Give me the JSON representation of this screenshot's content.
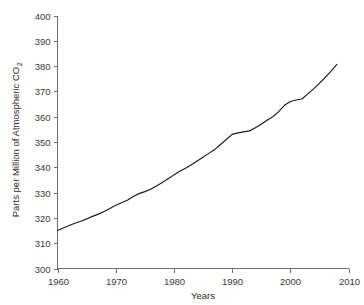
{
  "chart_data": {
    "type": "line",
    "title": "",
    "subtitle": "",
    "xlabel": "Years",
    "ylabel": "Parts per Million of Atmospheric CO2",
    "ylabel_main": "Parts per Million of Atmospheric CO",
    "ylabel_subscript": "2",
    "xlim": [
      1960,
      2010
    ],
    "ylim": [
      300,
      400
    ],
    "grid": false,
    "legend": false,
    "legend_position": "none",
    "line_color": "#1a1a1a",
    "axis_color": "#6e6e6e",
    "xticks": [
      1960,
      1970,
      1980,
      1990,
      2000,
      2010
    ],
    "xtick_labels": [
      "1960",
      "1970",
      "1980",
      "1990",
      "2000",
      "2010"
    ],
    "yticks": [
      300,
      310,
      320,
      330,
      340,
      350,
      360,
      370,
      380,
      390,
      400
    ],
    "ytick_labels": [
      "300",
      "310",
      "320",
      "330",
      "340",
      "350",
      "360",
      "370",
      "380",
      "390",
      "400"
    ],
    "series": [
      {
        "name": "Atmospheric CO2",
        "x": [
          1960,
          1961,
          1962,
          1963,
          1964,
          1965,
          1966,
          1967,
          1968,
          1969,
          1970,
          1971,
          1972,
          1973,
          1974,
          1975,
          1976,
          1977,
          1978,
          1979,
          1980,
          1981,
          1982,
          1983,
          1984,
          1985,
          1986,
          1987,
          1988,
          1989,
          1990,
          1991,
          1992,
          1993,
          1994,
          1995,
          1996,
          1997,
          1998,
          1999,
          2000,
          2001,
          2002,
          2003,
          2004,
          2005,
          2006,
          2007,
          2008
        ],
        "values": [
          315.0,
          316.0,
          317.0,
          317.9,
          318.7,
          319.6,
          320.6,
          321.5,
          322.5,
          323.7,
          325.0,
          326.0,
          327.0,
          328.5,
          329.6,
          330.4,
          331.3,
          332.6,
          334.0,
          335.5,
          337.0,
          338.4,
          339.6,
          341.0,
          342.5,
          344.0,
          345.5,
          347.0,
          349.0,
          351.0,
          353.0,
          353.6,
          354.0,
          354.4,
          355.6,
          357.0,
          358.6,
          360.0,
          362.0,
          364.5,
          366.0,
          366.6,
          367.0,
          369.0,
          371.0,
          373.2,
          375.5,
          378.0,
          380.7
        ]
      }
    ]
  },
  "axes": {
    "y_title_main": "Parts per Million of Atmospheric CO",
    "y_title_sub": "2",
    "x_title": "Years"
  }
}
